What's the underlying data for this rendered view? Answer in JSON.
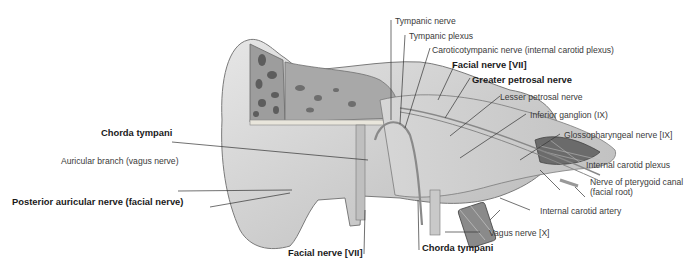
{
  "figure": {
    "labels": {
      "tympanic_nerve": "Tympanic nerve",
      "tympanic_plexus": "Tympanic plexus",
      "caroticotympanic_nerve": "Caroticotympanic nerve (internal carotid plexus)",
      "facial_nerve_top": "Facial nerve [VII]",
      "greater_petrosal_nerve": "Greater petrosal nerve",
      "lesser_petrosal_nerve": "Lesser petrosal nerve",
      "inferior_ganglion": "Inferior ganglion (IX)",
      "glossopharyngeal_nerve": "Glossopharyngeal nerve [IX]",
      "internal_carotid_plexus": "Internal carotid plexus",
      "nerve_pterygoid_canal_1": "Nerve of pterygoid canal",
      "nerve_pterygoid_canal_2": "(facial root)",
      "internal_carotid_artery": "Internal carotid artery",
      "vagus_nerve": "Vagus nerve [X]",
      "chorda_tympani_bottom": "Chorda tympani",
      "facial_nerve_bottom": "Facial nerve [VII]",
      "chorda_tympani_left": "Chorda tympani",
      "auricular_branch": "Auricular branch (vagus nerve)",
      "posterior_auricular_nerve": "Posterior auricular nerve (facial nerve)"
    }
  }
}
